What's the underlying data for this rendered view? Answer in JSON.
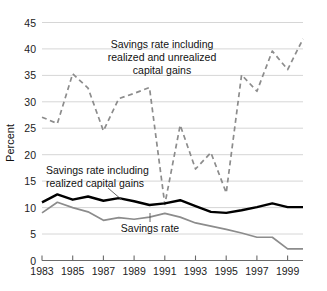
{
  "chart_data": {
    "type": "line",
    "title": "",
    "xlabel": "",
    "ylabel": "Percent",
    "xlim": [
      1983,
      2000
    ],
    "ylim": [
      0,
      45
    ],
    "grid": true,
    "legend_position": "inline-annotations",
    "x": [
      1983,
      1984,
      1985,
      1986,
      1987,
      1988,
      1989,
      1990,
      1991,
      1992,
      1993,
      1994,
      1995,
      1996,
      1997,
      1998,
      1999,
      2000
    ],
    "yticks": [
      0,
      5,
      10,
      15,
      20,
      25,
      30,
      35,
      40,
      45
    ],
    "ytick_labels": [
      "0",
      "5",
      "10",
      "15",
      "20",
      "25",
      "30",
      "35",
      "40",
      "45"
    ],
    "xticks": [
      1983,
      1985,
      1987,
      1989,
      1991,
      1993,
      1995,
      1997,
      1999
    ],
    "xtick_labels": [
      "1983",
      "1985",
      "1987",
      "1989",
      "1991",
      "1993",
      "1995",
      "1997",
      "1999"
    ],
    "series": [
      {
        "name": "Savings rate including realized and unrealized capital gains",
        "style": "dashed",
        "color": "#8c8c8c",
        "values": [
          27.1,
          25.9,
          35.3,
          32.6,
          24.5,
          30.6,
          31.6,
          32.7,
          10.6,
          25.6,
          17.3,
          20.4,
          12.8,
          35.1,
          32.0,
          39.6,
          36.1,
          41.9
        ]
      },
      {
        "name": "Savings rate including realized capital gains",
        "style": "solid",
        "color": "#000000",
        "values": [
          11.0,
          12.5,
          11.5,
          12.1,
          11.3,
          11.8,
          11.2,
          10.5,
          10.8,
          11.4,
          10.3,
          9.2,
          9.0,
          9.5,
          10.1,
          10.8,
          10.1,
          10.1
        ]
      },
      {
        "name": "Savings rate",
        "style": "solid",
        "color": "#8c8c8c",
        "values": [
          9.0,
          11.0,
          10.0,
          9.2,
          7.6,
          8.1,
          7.8,
          8.2,
          8.9,
          8.2,
          7.1,
          6.5,
          5.9,
          5.2,
          4.4,
          4.4,
          2.2,
          2.2
        ]
      }
    ],
    "annotations": [
      {
        "id": "annot-unrealized",
        "lines": [
          "Savings rate including",
          "realized and unrealized",
          "capital gains"
        ]
      },
      {
        "id": "annot-realized",
        "lines": [
          "Savings rate including",
          "realized capital gains"
        ]
      },
      {
        "id": "annot-savings-rate",
        "lines": [
          "Savings rate"
        ]
      }
    ],
    "colors": {
      "grid": "#d6d6d6",
      "axis": "#6a6a6a",
      "black_series": "#000000",
      "gray_series": "#8c8c8c",
      "dashed_series": "#9a9a9a",
      "background": "#ffffff"
    }
  }
}
